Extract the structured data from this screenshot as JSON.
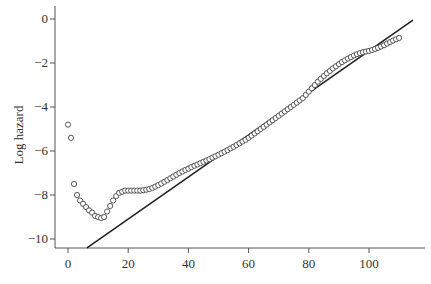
{
  "chart_data": {
    "type": "scatter",
    "title": "",
    "xlabel": "",
    "ylabel": "Log hazard",
    "xlim": [
      -4,
      115
    ],
    "ylim": [
      -10.4,
      0.3
    ],
    "xticks": [
      0,
      20,
      40,
      60,
      80,
      100
    ],
    "yticks": [
      0,
      -2,
      -4,
      -6,
      -8,
      -10
    ],
    "ytick_labels": [
      "0",
      "−2",
      "−4",
      "−6",
      "−8",
      "−10"
    ],
    "grid": false,
    "legend": null,
    "series": [
      {
        "name": "observed log hazard",
        "kind": "scatter",
        "marker": "open-circle",
        "x": [
          0,
          1,
          2,
          3,
          4,
          5,
          6,
          7,
          8,
          9,
          10,
          11,
          12,
          13,
          14,
          15,
          16,
          17,
          18,
          19,
          20,
          21,
          22,
          23,
          24,
          25,
          26,
          27,
          28,
          29,
          30,
          31,
          32,
          33,
          34,
          35,
          36,
          37,
          38,
          39,
          40,
          41,
          42,
          43,
          44,
          45,
          46,
          47,
          48,
          49,
          50,
          51,
          52,
          53,
          54,
          55,
          56,
          57,
          58,
          59,
          60,
          61,
          62,
          63,
          64,
          65,
          66,
          67,
          68,
          69,
          70,
          71,
          72,
          73,
          74,
          75,
          76,
          77,
          78,
          79,
          80,
          81,
          82,
          83,
          84,
          85,
          86,
          87,
          88,
          89,
          90,
          91,
          92,
          93,
          94,
          95,
          96,
          97,
          98,
          99,
          100,
          101,
          102,
          103,
          104,
          105,
          106,
          107,
          108,
          109,
          110
        ],
        "values": [
          -4.8,
          -5.4,
          -7.5,
          -8.0,
          -8.25,
          -8.4,
          -8.55,
          -8.7,
          -8.8,
          -8.95,
          -9.0,
          -9.05,
          -9.0,
          -8.75,
          -8.5,
          -8.25,
          -8.05,
          -7.9,
          -7.85,
          -7.8,
          -7.8,
          -7.8,
          -7.8,
          -7.8,
          -7.8,
          -7.78,
          -7.76,
          -7.73,
          -7.68,
          -7.62,
          -7.55,
          -7.48,
          -7.4,
          -7.32,
          -7.24,
          -7.16,
          -7.08,
          -7.0,
          -6.93,
          -6.86,
          -6.8,
          -6.73,
          -6.67,
          -6.61,
          -6.55,
          -6.49,
          -6.43,
          -6.37,
          -6.3,
          -6.24,
          -6.17,
          -6.1,
          -6.03,
          -5.96,
          -5.88,
          -5.81,
          -5.73,
          -5.65,
          -5.57,
          -5.49,
          -5.4,
          -5.3,
          -5.2,
          -5.1,
          -5.0,
          -4.9,
          -4.8,
          -4.7,
          -4.6,
          -4.5,
          -4.4,
          -4.3,
          -4.2,
          -4.1,
          -4.0,
          -3.9,
          -3.8,
          -3.7,
          -3.6,
          -3.45,
          -3.3,
          -3.15,
          -3.0,
          -2.85,
          -2.72,
          -2.59,
          -2.47,
          -2.36,
          -2.25,
          -2.15,
          -2.05,
          -1.96,
          -1.88,
          -1.8,
          -1.73,
          -1.66,
          -1.6,
          -1.55,
          -1.51,
          -1.48,
          -1.45,
          -1.41,
          -1.36,
          -1.31,
          -1.25,
          -1.19,
          -1.12,
          -1.05,
          -0.98,
          -0.92,
          -0.86
        ]
      },
      {
        "name": "Gompertz fit",
        "kind": "line",
        "x": [
          6.3,
          114.6
        ],
        "values": [
          -10.4,
          -0.05
        ]
      }
    ]
  }
}
